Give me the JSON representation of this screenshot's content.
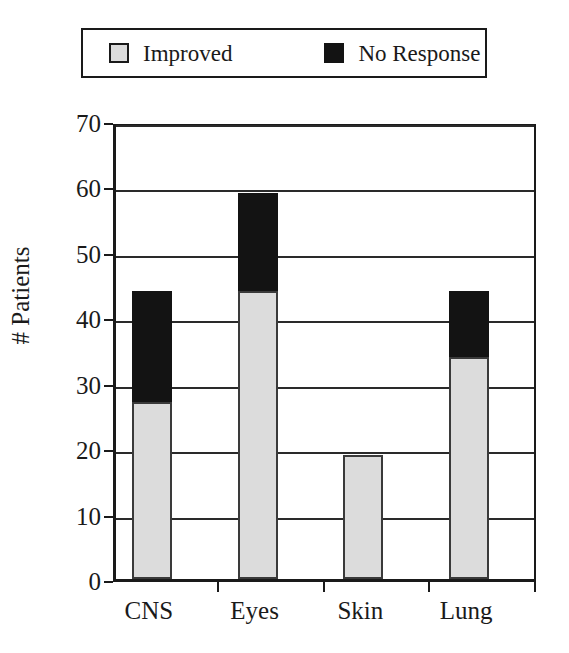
{
  "legend": {
    "entries": [
      {
        "label": "Improved",
        "swatch": "light-gray-square",
        "color": "#dcdcdc"
      },
      {
        "label": "No Response",
        "swatch": "black-square",
        "color": "#131313"
      }
    ]
  },
  "axes": {
    "ylabel": "# Patients",
    "yticks": [
      "0",
      "10",
      "20",
      "30",
      "40",
      "50",
      "60",
      "70"
    ],
    "xticks": [
      "CNS",
      "Eyes",
      "Skin",
      "Lung"
    ]
  },
  "chart_data": {
    "type": "bar",
    "subtype": "stacked",
    "title": "",
    "xlabel": "",
    "ylabel": "# Patients",
    "categories": [
      "CNS",
      "Eyes",
      "Skin",
      "Lung"
    ],
    "series": [
      {
        "name": "Improved",
        "color": "#dcdcdc",
        "values": [
          27,
          44,
          19,
          34
        ]
      },
      {
        "name": "No Response",
        "color": "#131313",
        "values": [
          17,
          15,
          0,
          10
        ]
      }
    ],
    "totals": [
      44,
      59,
      19,
      44
    ],
    "ylim": [
      0,
      70
    ],
    "ytick_step": 10,
    "grid": true,
    "legend_position": "top"
  }
}
